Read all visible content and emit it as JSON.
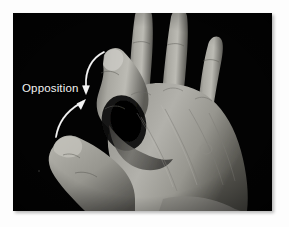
{
  "figure": {
    "domain": "anatomy-photograph",
    "image_style": "black-and-white photograph on black background",
    "plate": {
      "background_color": "#030303",
      "page_color": "#fdfdfd",
      "left": 13,
      "top": 13,
      "width": 259,
      "height": 198
    }
  },
  "annotations": {
    "label": {
      "text": "Opposition",
      "color": "#f2f2f2",
      "x": 22,
      "y": 82,
      "font_size_px": 11.5
    },
    "arrows": [
      {
        "name": "arrow-from-index-fingertip",
        "description": "curved white arrow sweeping from the index fingertip downward to the contact point",
        "color": "#f4f4f4",
        "start": {
          "x": 104,
          "y": 52
        },
        "end": {
          "x": 88,
          "y": 93
        },
        "head": "down"
      },
      {
        "name": "arrow-from-thumb-tip",
        "description": "curved white arrow sweeping from the thumb tip upward to the contact point",
        "color": "#f4f4f4",
        "start": {
          "x": 58,
          "y": 136
        },
        "end": {
          "x": 86,
          "y": 99
        },
        "head": "up-right"
      }
    ]
  },
  "hand": {
    "skin_tone_mid": "#9b9a95",
    "skin_tone_light": "#c9c8c2",
    "skin_tone_shadow": "#4a4a47",
    "parts": [
      {
        "name": "thumb",
        "label": "thumb curled up toward index finger"
      },
      {
        "name": "index-finger",
        "label": "index finger curled down toward thumb"
      },
      {
        "name": "middle-finger",
        "label": "middle finger extended upward"
      },
      {
        "name": "ring-finger",
        "label": "ring finger extended upward"
      },
      {
        "name": "little-finger",
        "label": "little finger extended to the right"
      },
      {
        "name": "dorsum",
        "label": "back of the hand"
      },
      {
        "name": "wrist",
        "label": "wrist at lower right"
      }
    ]
  }
}
